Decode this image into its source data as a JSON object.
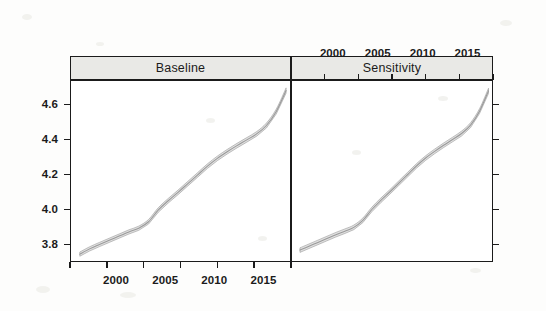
{
  "figure": {
    "title": "",
    "background_color": "#fdfdfc",
    "ink_color": "#1b1b1b",
    "band_color": "#c9c9c9",
    "line_color": "#9a9a9a",
    "strip_fill": "#e9e9e6"
  },
  "panels": [
    {
      "id": "baseline",
      "label": "Baseline",
      "axis_side_x": "bottom",
      "y_labels_shown": true
    },
    {
      "id": "sensitivity",
      "label": "Sensitivity",
      "axis_side_x": "top",
      "y_labels_shown": false
    }
  ],
  "axes": {
    "y_ticks": [
      "3.8",
      "4.0",
      "4.2",
      "4.4",
      "4.6"
    ],
    "y_tick_values": [
      3.8,
      4.0,
      4.2,
      4.4,
      4.6
    ],
    "x_ticks": [
      "2000",
      "2005",
      "2010",
      "2015"
    ],
    "x_tick_values": [
      2000,
      2005,
      2010,
      2015
    ],
    "y_minor_count": 5,
    "x_minor_count": 6
  },
  "chart_data": {
    "type": "line",
    "title": "",
    "subtitle": "",
    "xlabel": "",
    "ylabel": "",
    "xlim": [
      1995.0,
      2017.5
    ],
    "ylim": [
      3.7,
      4.74
    ],
    "grid": false,
    "legend": "none",
    "layout": "2 panels side-by-side (trellis/lattice)",
    "panel_labels": [
      "Baseline",
      "Sensitivity"
    ],
    "x": [
      1996,
      1997,
      1998,
      1999,
      2000,
      2001,
      2002,
      2003,
      2004,
      2005,
      2006,
      2007,
      2008,
      2009,
      2010,
      2011,
      2012,
      2013,
      2014,
      2015,
      2016,
      2017
    ],
    "series": [
      {
        "name": "Baseline fit",
        "panel": "Baseline",
        "values": [
          3.745,
          3.775,
          3.8,
          3.824,
          3.848,
          3.872,
          3.893,
          3.93,
          3.998,
          4.05,
          4.098,
          4.148,
          4.198,
          4.248,
          4.292,
          4.33,
          4.365,
          4.398,
          4.432,
          4.48,
          4.56,
          4.68
        ]
      },
      {
        "name": "Baseline upper band",
        "panel": "Baseline",
        "values": [
          3.757,
          3.787,
          3.812,
          3.836,
          3.86,
          3.884,
          3.905,
          3.943,
          4.011,
          4.063,
          4.111,
          4.161,
          4.211,
          4.261,
          4.305,
          4.343,
          4.378,
          4.411,
          4.445,
          4.494,
          4.574,
          4.695
        ]
      },
      {
        "name": "Baseline lower band",
        "panel": "Baseline",
        "values": [
          3.733,
          3.763,
          3.788,
          3.812,
          3.836,
          3.86,
          3.881,
          3.917,
          3.985,
          4.037,
          4.085,
          4.135,
          4.185,
          4.235,
          4.279,
          4.317,
          4.352,
          4.385,
          4.419,
          4.466,
          4.546,
          4.665
        ]
      },
      {
        "name": "Sensitivity fit",
        "panel": "Sensitivity",
        "values": [
          3.768,
          3.79,
          3.812,
          3.834,
          3.856,
          3.876,
          3.898,
          3.938,
          4.0,
          4.052,
          4.1,
          4.15,
          4.2,
          4.25,
          4.294,
          4.332,
          4.367,
          4.4,
          4.434,
          4.482,
          4.562,
          4.678
        ]
      },
      {
        "name": "Sensitivity upper band",
        "panel": "Sensitivity",
        "values": [
          3.781,
          3.803,
          3.825,
          3.847,
          3.869,
          3.889,
          3.911,
          3.951,
          4.013,
          4.065,
          4.113,
          4.163,
          4.213,
          4.263,
          4.307,
          4.345,
          4.38,
          4.413,
          4.448,
          4.496,
          4.576,
          4.693
        ]
      },
      {
        "name": "Sensitivity lower band",
        "panel": "Sensitivity",
        "values": [
          3.755,
          3.777,
          3.799,
          3.821,
          3.843,
          3.863,
          3.885,
          3.925,
          3.987,
          4.039,
          4.087,
          4.137,
          4.187,
          4.237,
          4.281,
          4.319,
          4.354,
          4.387,
          4.42,
          4.468,
          4.548,
          4.663
        ]
      }
    ]
  }
}
